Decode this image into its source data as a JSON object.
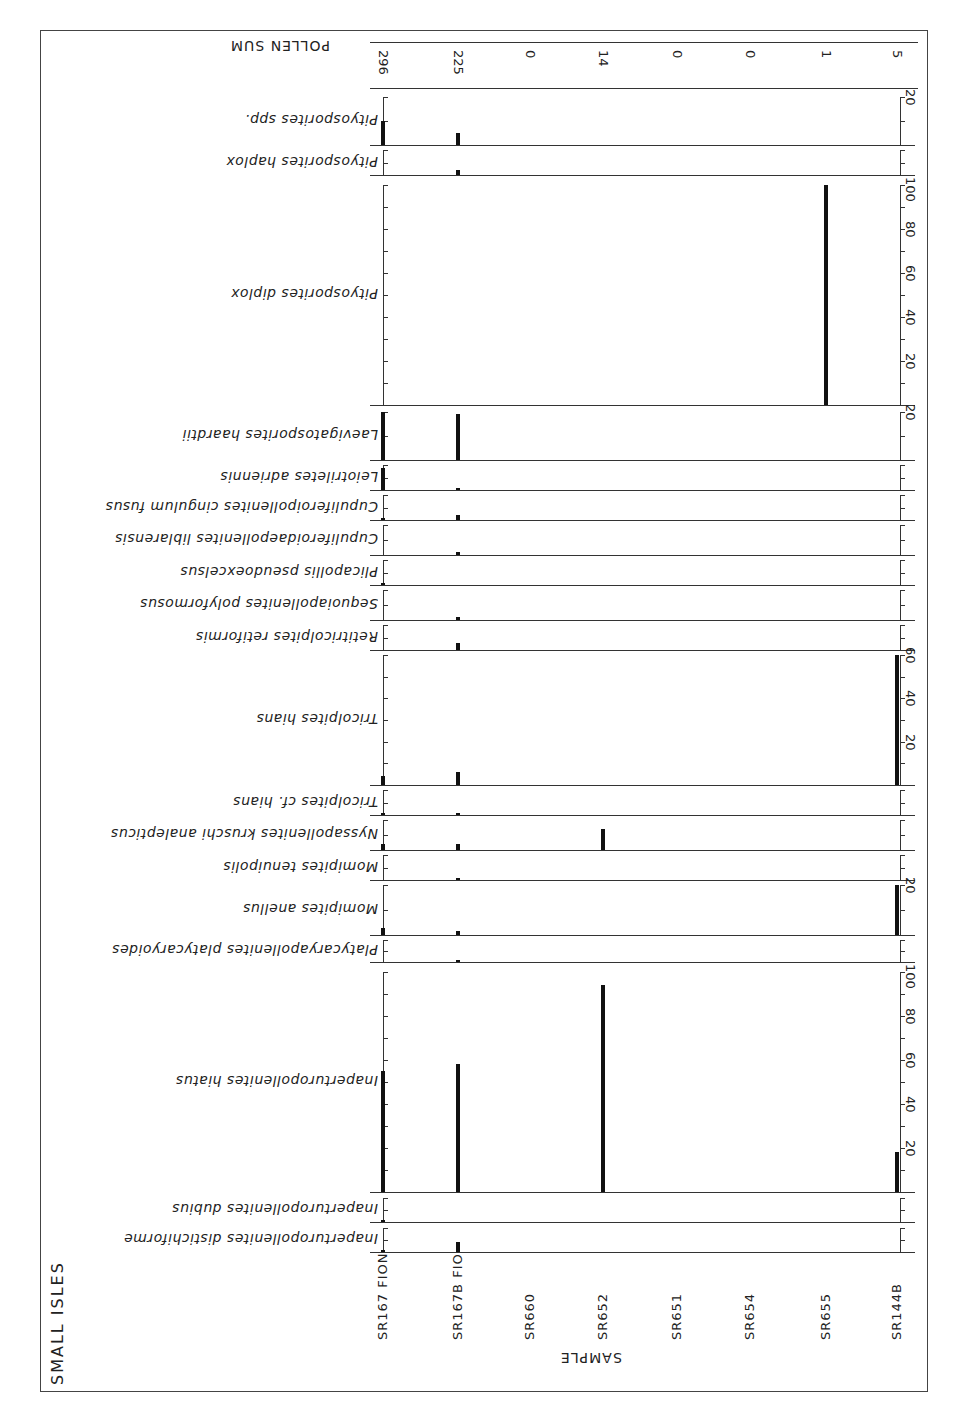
{
  "title": "SMALL ISLES",
  "axis_label": "SAMPLE",
  "pollen_sum_label": "POLLEN SUM",
  "chart_data": {
    "type": "bar",
    "orientation": "scanned pollen diagram, rotated 90°; samples along vertical axis, taxa as horizontal panels; taxon labels and header text printed upside-down",
    "title": "SMALL ISLES",
    "xlabel": "SAMPLE",
    "ylabel": "Percentage (%)",
    "categories": [
      "SR167 FION",
      "SR167B FIO",
      "SR660",
      "SR652",
      "SR651",
      "SR654",
      "SR655",
      "SR144B"
    ],
    "pollen_sum": [
      296,
      225,
      0,
      14,
      0,
      0,
      1,
      5
    ],
    "series": [
      {
        "name": "Pityosporites spp.",
        "scale_max": 20,
        "values": [
          10,
          5,
          0,
          0,
          0,
          0,
          0,
          0
        ]
      },
      {
        "name": "Pityosporites haplox",
        "scale_max": 10,
        "values": [
          0,
          2,
          0,
          0,
          0,
          0,
          0,
          0
        ]
      },
      {
        "name": "Pityosporites diplox",
        "scale_max": 100,
        "values": [
          0,
          0,
          0,
          0,
          0,
          0,
          100,
          0
        ]
      },
      {
        "name": "Laevigatosporites haardtii",
        "scale_max": 20,
        "values": [
          20,
          19,
          0,
          0,
          0,
          0,
          0,
          0
        ]
      },
      {
        "name": "Leiotriletes adriennis",
        "scale_max": 10,
        "values": [
          9,
          1,
          0,
          0,
          0,
          0,
          0,
          0
        ]
      },
      {
        "name": "Cupuliferoipollenites cingulum fusus",
        "scale_max": 10,
        "values": [
          1,
          2,
          0,
          0,
          0,
          0,
          0,
          0
        ]
      },
      {
        "name": "Cupuliferoidaepollenites liblarensis",
        "scale_max": 10,
        "values": [
          0,
          1,
          0,
          0,
          0,
          0,
          0,
          0
        ]
      },
      {
        "name": "Plicapollis pseudoexcelsus",
        "scale_max": 10,
        "values": [
          1,
          0,
          0,
          0,
          0,
          0,
          0,
          0
        ]
      },
      {
        "name": "Sequoiapollenites polyformosus",
        "scale_max": 10,
        "values": [
          0,
          1,
          0,
          0,
          0,
          0,
          0,
          0
        ]
      },
      {
        "name": "Retitricolpites retiformis",
        "scale_max": 10,
        "values": [
          0,
          3,
          0,
          0,
          0,
          0,
          0,
          0
        ]
      },
      {
        "name": "Tricolpites hians",
        "scale_max": 60,
        "values": [
          4,
          6,
          0,
          0,
          0,
          0,
          0,
          60
        ]
      },
      {
        "name": "Tricolpites cf. hians",
        "scale_max": 10,
        "values": [
          1,
          0.5,
          0,
          0,
          0,
          0,
          0,
          0
        ]
      },
      {
        "name": "Nyssapollenites kruschi analepticus",
        "scale_max": 10,
        "values": [
          2,
          2,
          0,
          7,
          0,
          0,
          0,
          0
        ]
      },
      {
        "name": "Momipites tenuipolis",
        "scale_max": 10,
        "values": [
          0,
          0.5,
          0,
          0,
          0,
          0,
          0,
          0
        ]
      },
      {
        "name": "Momipites anellus",
        "scale_max": 20,
        "values": [
          3,
          1.5,
          0,
          0,
          0,
          0,
          0,
          20
        ]
      },
      {
        "name": "Platycaryapollenites platycaryoides",
        "scale_max": 10,
        "values": [
          0,
          1,
          0,
          0,
          0,
          0,
          0,
          0
        ]
      },
      {
        "name": "Inaperturopollenites hiatus",
        "scale_max": 100,
        "values": [
          55,
          58,
          0,
          94,
          0,
          0,
          0,
          18
        ]
      },
      {
        "name": "Inaperturopollenites dubius",
        "scale_max": 10,
        "values": [
          1,
          0,
          0,
          0,
          0,
          0,
          0,
          0
        ]
      },
      {
        "name": "Inaperturopollenites distichiforme",
        "scale_max": 10,
        "values": [
          1,
          4,
          0,
          0,
          0,
          0,
          0,
          0
        ]
      }
    ],
    "scale_tick_labels": {
      "Pityosporites spp.": [
        "20"
      ],
      "Pityosporites diplox": [
        "20",
        "40",
        "60",
        "80",
        "100"
      ],
      "Laevigatosporites haardtii": [
        "20"
      ],
      "Tricolpites hians": [
        "20",
        "40",
        "60"
      ],
      "Momipites anellus": [
        "20"
      ],
      "Inaperturopollenites hiatus": [
        "20",
        "40",
        "60",
        "80",
        "100"
      ]
    },
    "grid": false,
    "legend": "none"
  }
}
